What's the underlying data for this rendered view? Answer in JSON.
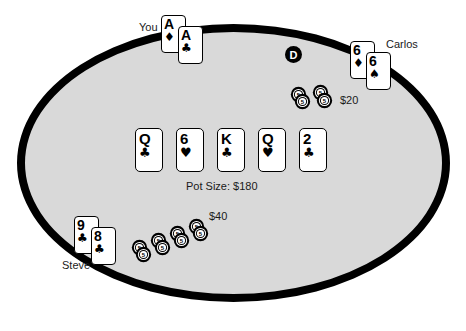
{
  "scene": {
    "type": "poker-table",
    "table_shape": "ellipse",
    "felt_color": "#d9d9d9",
    "border_color": "#000000",
    "background_color": "#ffffff"
  },
  "pot": {
    "label": "Pot Size: $180",
    "amount": 180
  },
  "dealer_button": {
    "label": "D"
  },
  "board": {
    "name": "community-cards",
    "cards": [
      {
        "rank": "Q",
        "suit": "♣",
        "suit_name": "clubs"
      },
      {
        "rank": "6",
        "suit": "♥",
        "suit_name": "hearts"
      },
      {
        "rank": "K",
        "suit": "♣",
        "suit_name": "clubs"
      },
      {
        "rank": "Q",
        "suit": "♥",
        "suit_name": "hearts"
      },
      {
        "rank": "2",
        "suit": "♣",
        "suit_name": "clubs"
      }
    ]
  },
  "players": [
    {
      "id": "you",
      "name": "You",
      "cards": [
        {
          "rank": "A",
          "suit": "♦",
          "suit_name": "diamonds"
        },
        {
          "rank": "A",
          "suit": "♣",
          "suit_name": "clubs"
        }
      ],
      "bet_label": "",
      "bet_amount": 0,
      "chip_count": 0
    },
    {
      "id": "carlos",
      "name": "Carlos",
      "cards": [
        {
          "rank": "6",
          "suit": "♦",
          "suit_name": "diamonds"
        },
        {
          "rank": "6",
          "suit": "♠",
          "suit_name": "spades"
        }
      ],
      "bet_label": "$20",
      "bet_amount": 20,
      "chip_count": 4
    },
    {
      "id": "steve",
      "name": "Steve",
      "cards": [
        {
          "rank": "9",
          "suit": "♣",
          "suit_name": "clubs"
        },
        {
          "rank": "8",
          "suit": "♣",
          "suit_name": "clubs"
        }
      ],
      "bet_label": "$40",
      "bet_amount": 40,
      "chip_count": 8
    }
  ],
  "chip": {
    "denomination": "5",
    "denomination_label": "5"
  }
}
